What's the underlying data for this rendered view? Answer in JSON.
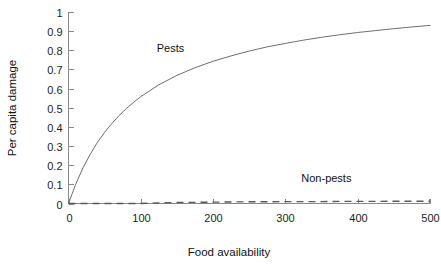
{
  "chart_data": {
    "type": "line",
    "title": "",
    "xlabel": "Food availability",
    "ylabel": "Per capita damage",
    "xlim": [
      0,
      500
    ],
    "ylim": [
      0,
      1
    ],
    "grid": false,
    "legend_position": "inline-annotations",
    "xticks": [
      "0",
      "100",
      "200",
      "300",
      "400",
      "500"
    ],
    "xtick_values": [
      0,
      100,
      200,
      300,
      400,
      500
    ],
    "yticks": [
      "0",
      "0.1",
      "0.2",
      "0.3",
      "0.4",
      "0.5",
      "0.6",
      "0.7",
      "0.8",
      "0.9",
      "1"
    ],
    "ytick_values": [
      0,
      0.1,
      0.2,
      0.3,
      0.4,
      0.5,
      0.6,
      0.7,
      0.8,
      0.9,
      1
    ],
    "x": [
      0,
      10,
      20,
      30,
      40,
      50,
      60,
      70,
      80,
      90,
      100,
      125,
      150,
      175,
      200,
      225,
      250,
      275,
      300,
      325,
      350,
      375,
      400,
      425,
      450,
      475,
      500
    ],
    "series": [
      {
        "name": "Pests",
        "style": "solid",
        "color": "#6e6e6e",
        "values": [
          0.0,
          0.101,
          0.186,
          0.257,
          0.319,
          0.372,
          0.418,
          0.459,
          0.496,
          0.528,
          0.558,
          0.62,
          0.669,
          0.709,
          0.743,
          0.771,
          0.796,
          0.818,
          0.836,
          0.853,
          0.868,
          0.881,
          0.893,
          0.903,
          0.913,
          0.922,
          0.93
        ],
        "annotation": {
          "text": "Pests",
          "x": 122,
          "y": 0.79
        }
      },
      {
        "name": "Non-pests",
        "style": "dashed",
        "color": "#5a5a5a",
        "values": [
          0.0,
          0.0,
          0.0,
          0.0,
          0.0,
          0.0,
          0.0,
          0.0,
          0.0,
          0.0,
          0.0,
          0.003,
          0.005,
          0.006,
          0.007,
          0.008,
          0.009,
          0.009,
          0.01,
          0.01,
          0.01,
          0.011,
          0.011,
          0.011,
          0.012,
          0.012,
          0.012
        ],
        "annotation": {
          "text": "Non-pests",
          "x": 322,
          "y": 0.115
        }
      }
    ]
  },
  "axes": {
    "x_title": "Food availability",
    "y_title": "Per capita damage"
  },
  "labels": {
    "pests": "Pests",
    "nonpests": "Non-pests"
  }
}
